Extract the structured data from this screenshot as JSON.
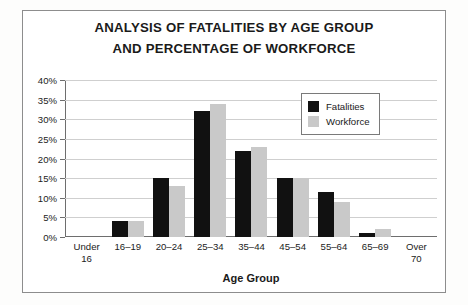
{
  "chart_data": {
    "type": "bar",
    "title": "ANALYSIS OF FATALITIES BY AGE GROUP AND PERCENTAGE OF WORKFORCE",
    "title_lines": [
      "ANALYSIS OF FATALITIES BY AGE GROUP",
      "AND PERCENTAGE OF WORKFORCE"
    ],
    "xlabel": "Age Group",
    "ylabel": "",
    "ylim": [
      0,
      40
    ],
    "ytick_labels": [
      "40%",
      "35%",
      "30%",
      "25%",
      "20%",
      "15%",
      "10%",
      "5%",
      "0%"
    ],
    "ytick_values": [
      40,
      35,
      30,
      25,
      20,
      15,
      10,
      5,
      0
    ],
    "grid": true,
    "legend_position": "upper right",
    "categories": [
      "Under 16",
      "16–19",
      "20–24",
      "25–34",
      "35–44",
      "45–54",
      "55–64",
      "65–69",
      "Over 70"
    ],
    "category_lines": [
      [
        "Under",
        "16"
      ],
      [
        "16–19"
      ],
      [
        "20–24"
      ],
      [
        "25–34"
      ],
      [
        "35–44"
      ],
      [
        "45–54"
      ],
      [
        "55–64"
      ],
      [
        "65–69"
      ],
      [
        "Over",
        "70"
      ]
    ],
    "series": [
      {
        "name": "Fatalities",
        "color": "#111111",
        "values": [
          0,
          4,
          15,
          32,
          22,
          15,
          11.5,
          1,
          0
        ]
      },
      {
        "name": "Workforce",
        "color": "#c9c9c9",
        "values": [
          0,
          4,
          13,
          34,
          23,
          15,
          9,
          2,
          0
        ]
      }
    ]
  },
  "legend": {
    "items": [
      {
        "label": "Fatalities",
        "color": "#111111"
      },
      {
        "label": "Workforce",
        "color": "#c9c9c9"
      }
    ]
  }
}
